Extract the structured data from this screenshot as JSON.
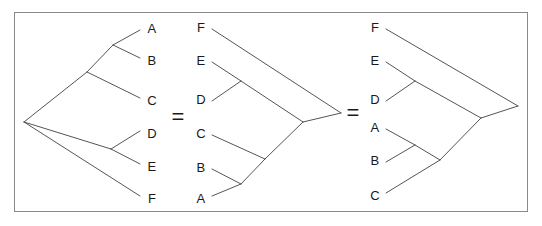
{
  "figure": {
    "background_color": "#ffffff",
    "frame": {
      "x": 14,
      "y": 12,
      "width": 514,
      "height": 200,
      "border_color": "#8a8a8a",
      "border_width": 1
    },
    "line_color": "#555555",
    "line_width": 1,
    "label_color": "#1a1a1a"
  },
  "operators": [
    {
      "symbol": "=",
      "x": 178,
      "y": 117
    },
    {
      "symbol": "=",
      "x": 353,
      "y": 113
    }
  ],
  "trees": [
    {
      "id": "tree-left",
      "orientation": "tips-right",
      "root": {
        "x": 24,
        "y": 122
      },
      "tips": [
        {
          "label": "A",
          "label_x": 152,
          "label_y": 28,
          "tip_x": 140,
          "tip_y": 30
        },
        {
          "label": "B",
          "label_x": 152,
          "label_y": 60,
          "tip_x": 140,
          "tip_y": 58
        },
        {
          "label": "C",
          "label_x": 152,
          "label_y": 100,
          "tip_x": 140,
          "tip_y": 98
        },
        {
          "label": "D",
          "label_x": 152,
          "label_y": 133,
          "tip_x": 140,
          "tip_y": 131
        },
        {
          "label": "E",
          "label_x": 152,
          "label_y": 166,
          "tip_x": 140,
          "tip_y": 164
        },
        {
          "label": "F",
          "label_x": 152,
          "label_y": 198,
          "tip_x": 140,
          "tip_y": 196
        }
      ],
      "internal_nodes": [
        {
          "id": "ab",
          "x": 113,
          "y": 45
        },
        {
          "id": "abc",
          "x": 87,
          "y": 72
        },
        {
          "id": "de",
          "x": 111,
          "y": 149
        },
        {
          "id": "root",
          "x": 24,
          "y": 122
        }
      ],
      "edges": [
        {
          "from": "ab",
          "to_tip": "A"
        },
        {
          "from": "ab",
          "to_tip": "B"
        },
        {
          "from": "abc",
          "to_node": "ab"
        },
        {
          "from": "abc",
          "to_tip": "C"
        },
        {
          "from": "root",
          "to_node": "abc"
        },
        {
          "from": "de",
          "to_tip": "D"
        },
        {
          "from": "de",
          "to_tip": "E"
        },
        {
          "from": "root",
          "to_node": "de"
        },
        {
          "from": "root",
          "to_tip": "F"
        }
      ],
      "newick": "(((A,B),C),(D,E),F);"
    },
    {
      "id": "tree-middle",
      "orientation": "tips-left",
      "root": {
        "x": 341,
        "y": 113
      },
      "tips": [
        {
          "label": "F",
          "label_x": 201,
          "label_y": 27,
          "tip_x": 212,
          "tip_y": 29
        },
        {
          "label": "E",
          "label_x": 201,
          "label_y": 60,
          "tip_x": 212,
          "tip_y": 62
        },
        {
          "label": "D",
          "label_x": 201,
          "label_y": 99,
          "tip_x": 212,
          "tip_y": 101
        },
        {
          "label": "C",
          "label_x": 201,
          "label_y": 133,
          "tip_x": 212,
          "tip_y": 135
        },
        {
          "label": "B",
          "label_x": 201,
          "label_y": 167,
          "tip_x": 212,
          "tip_y": 169
        },
        {
          "label": "A",
          "label_x": 201,
          "label_y": 198,
          "tip_x": 212,
          "tip_y": 196
        }
      ],
      "internal_nodes": [
        {
          "id": "ed",
          "x": 241,
          "y": 81
        },
        {
          "id": "ba",
          "x": 241,
          "y": 184
        },
        {
          "id": "bac",
          "x": 265,
          "y": 159
        },
        {
          "id": "edc",
          "x": 303,
          "y": 122
        },
        {
          "id": "root",
          "x": 341,
          "y": 113
        }
      ],
      "edges": [
        {
          "from": "ed",
          "to_tip": "E"
        },
        {
          "from": "ed",
          "to_tip": "D"
        },
        {
          "from": "ba",
          "to_tip": "B"
        },
        {
          "from": "ba",
          "to_tip": "A"
        },
        {
          "from": "bac",
          "to_node": "ba"
        },
        {
          "from": "bac",
          "to_tip": "C"
        },
        {
          "from": "edc",
          "to_node": "ed"
        },
        {
          "from": "edc",
          "to_node": "bac"
        },
        {
          "from": "root",
          "to_node": "edc"
        },
        {
          "from": "root",
          "to_tip": "F"
        }
      ],
      "newick": "(((E,D),(C,(B,A))),F);"
    },
    {
      "id": "tree-right",
      "orientation": "tips-left",
      "root": {
        "x": 518,
        "y": 106
      },
      "tips": [
        {
          "label": "F",
          "label_x": 375,
          "label_y": 27,
          "tip_x": 386,
          "tip_y": 29
        },
        {
          "label": "E",
          "label_x": 375,
          "label_y": 60,
          "tip_x": 386,
          "tip_y": 62
        },
        {
          "label": "D",
          "label_x": 375,
          "label_y": 99,
          "tip_x": 386,
          "tip_y": 101
        },
        {
          "label": "A",
          "label_x": 375,
          "label_y": 127,
          "tip_x": 386,
          "tip_y": 129
        },
        {
          "label": "B",
          "label_x": 375,
          "label_y": 160,
          "tip_x": 386,
          "tip_y": 162
        },
        {
          "label": "C",
          "label_x": 375,
          "label_y": 195,
          "tip_x": 386,
          "tip_y": 193
        }
      ],
      "internal_nodes": [
        {
          "id": "ed",
          "x": 415,
          "y": 81
        },
        {
          "id": "ab",
          "x": 415,
          "y": 145
        },
        {
          "id": "abc",
          "x": 440,
          "y": 160
        },
        {
          "id": "edab",
          "x": 481,
          "y": 118
        },
        {
          "id": "root",
          "x": 518,
          "y": 106
        }
      ],
      "edges": [
        {
          "from": "ed",
          "to_tip": "E"
        },
        {
          "from": "ed",
          "to_tip": "D"
        },
        {
          "from": "ab",
          "to_tip": "A"
        },
        {
          "from": "ab",
          "to_tip": "B"
        },
        {
          "from": "abc",
          "to_node": "ab"
        },
        {
          "from": "abc",
          "to_tip": "C"
        },
        {
          "from": "edab",
          "to_node": "ed"
        },
        {
          "from": "edab",
          "to_node": "abc"
        },
        {
          "from": "root",
          "to_node": "edab"
        },
        {
          "from": "root",
          "to_tip": "F"
        }
      ],
      "newick": "(((E,D),(C,(A,B))),F);"
    }
  ]
}
